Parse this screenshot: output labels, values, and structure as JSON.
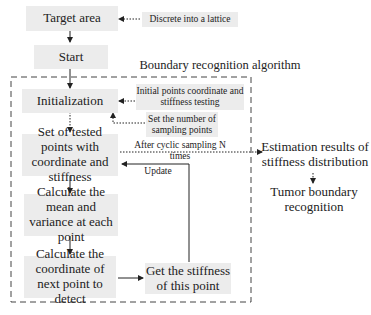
{
  "diagram": {
    "group_title": "Boundary recognition algorithm",
    "nodes": {
      "target_area": "Target area",
      "start": "Start",
      "initialization": "Initialization",
      "tested_points": "Set of tested points with coordinate and stiffness",
      "mean_variance": "Calculate the mean and variance at each point",
      "next_point": "Calculate the coordinate of next point to detect",
      "get_stiffness": "Get the stiffness of this point",
      "estimation": "Estimation results of stiffness distribution",
      "tumor_boundary": "Tumor boundary recognition"
    },
    "notes": {
      "discrete": "Discrete into a lattice",
      "initial_points": "Initial points coordinate and stiffness testing",
      "set_number": "Set the number of sampling points"
    },
    "edge_labels": {
      "after_sampling": "After cyclic sampling N times",
      "update": "Update"
    },
    "colors": {
      "box_fill": "#ececec",
      "line": "#333333"
    }
  }
}
